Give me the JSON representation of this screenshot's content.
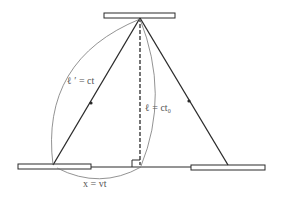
{
  "diagram": {
    "labels": {
      "moving_path": "ℓ ′ = ct",
      "rest_path": "ℓ = ct",
      "rest_path_subscript": "0",
      "displacement": "x = vt"
    },
    "elements": {
      "top_mirror": "mirror",
      "left_mirror": "mirror",
      "right_mirror": "mirror",
      "vertical_light_path": "dashed",
      "diagonal_paths": 2,
      "right_angle_marker": true
    },
    "colors": {
      "line": "#2a2a2a",
      "mirror_fill": "#ffffff",
      "arc": "#777777",
      "text": "#555555"
    }
  }
}
